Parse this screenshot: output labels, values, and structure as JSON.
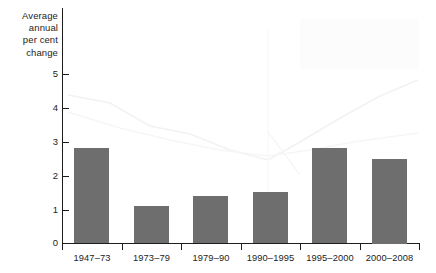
{
  "chart_data": {
    "type": "bar",
    "title": "",
    "subtitle": "",
    "xlabel": "",
    "ylabel": "Average annual per cent change",
    "ylabel_lines": [
      "Average",
      "annual",
      "per cent",
      "change"
    ],
    "categories": [
      "1947–73",
      "1973–79",
      "1979–90",
      "1990–1995",
      "1995–2000",
      "2000–2008"
    ],
    "values": [
      2.8,
      1.1,
      1.4,
      1.5,
      2.8,
      2.5
    ],
    "ylim": [
      0,
      5
    ],
    "ytick_labels": [
      "0",
      "1",
      "2",
      "3",
      "4",
      "5"
    ],
    "ytick_values": [
      0,
      1,
      2,
      3,
      4,
      5
    ],
    "grid": false,
    "legend": null,
    "bar_color": "#6e6e6e",
    "axis_color": "#1d1d1d",
    "background_color": "#ffffff"
  }
}
